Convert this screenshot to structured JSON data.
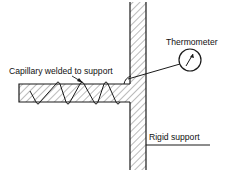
{
  "diagram": {
    "labels": {
      "capillary": "Capillary welded to support",
      "thermometer": "Thermometer",
      "rigid_support": "Rigid support"
    },
    "colors": {
      "line": "#1a1a1a",
      "hatch": "#444444",
      "background": "#ffffff"
    }
  }
}
